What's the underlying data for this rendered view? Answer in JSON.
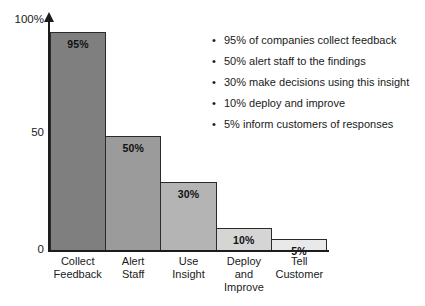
{
  "chart_data": {
    "type": "bar",
    "title": "",
    "subtitle": "",
    "xlabel": "",
    "ylabel": "",
    "categories": [
      "Collect Feedback",
      "Alert Staff",
      "Use Insight",
      "Deploy and Improve",
      "Tell Customer"
    ],
    "category_lines": [
      [
        "Collect",
        "Feedback"
      ],
      [
        "Alert",
        "Staff"
      ],
      [
        "Use",
        "Insight"
      ],
      [
        "Deploy",
        "and",
        "Improve"
      ],
      [
        "Tell",
        "Customer"
      ]
    ],
    "values": [
      95,
      50,
      30,
      10,
      5
    ],
    "value_labels": [
      "95%",
      "50%",
      "30%",
      "10%",
      "5%"
    ],
    "bar_colors": [
      "#7f7f7f",
      "#9b9b9b",
      "#b4b4b4",
      "#d5d5d5",
      "#e9e9e9"
    ],
    "bar_border_color": "#2a2a2a",
    "ylim": [
      0,
      100
    ],
    "yticks": [
      0,
      50,
      100
    ],
    "ytick_labels": [
      "0",
      "50",
      "100%"
    ],
    "grid": false,
    "legend": "none",
    "axis_color": "#1c1c1c",
    "y_axis_arrow": true
  },
  "y_axis": {
    "label_100": "100%",
    "label_50": "50",
    "label_0": "0"
  },
  "bullets": {
    "marker": "•",
    "items": [
      "95% of companies collect feedback",
      "50% alert staff to the findings",
      "30% make decisions using this insight",
      "10% deploy and improve",
      "5% inform customers of responses"
    ]
  }
}
